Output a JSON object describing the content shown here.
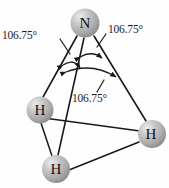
{
  "figure": {
    "background_color": "#fefefe",
    "width": 169,
    "height": 188
  },
  "atoms": [
    {
      "id": "n",
      "symbol": "N",
      "name": "nitrogen-atom",
      "cx": 85,
      "cy": 23,
      "r": 14.5,
      "color": "#a9a9a9"
    },
    {
      "id": "h1",
      "symbol": "H",
      "name": "hydrogen-atom-left",
      "cx": 40,
      "cy": 110,
      "r": 13.5,
      "color": "#a9a9a9"
    },
    {
      "id": "h2",
      "symbol": "H",
      "name": "hydrogen-atom-right",
      "cx": 152,
      "cy": 134,
      "r": 14.0,
      "color": "#a9a9a9"
    },
    {
      "id": "h3",
      "symbol": "H",
      "name": "hydrogen-atom-bottom",
      "cx": 56,
      "cy": 169,
      "r": 14.0,
      "color": "#a9a9a9"
    }
  ],
  "bonds": [
    {
      "name": "bond-n-h-left",
      "from": "n",
      "to": "h1"
    },
    {
      "name": "bond-n-h-right",
      "from": "n",
      "to": "h2"
    },
    {
      "name": "bond-n-h-bottom",
      "from": "n",
      "to": "h3"
    }
  ],
  "base_edges": [
    {
      "name": "base-edge-left-right",
      "from": "h1",
      "to": "h2"
    },
    {
      "name": "base-edge-left-bottom",
      "from": "h1",
      "to": "h3"
    },
    {
      "name": "base-edge-bottom-right",
      "from": "h3",
      "to": "h2"
    }
  ],
  "angles": {
    "left": {
      "value": "106.75",
      "unit": "°",
      "text": "106.75°"
    },
    "right": {
      "value": "106.75",
      "unit": "°",
      "text": "106.75°"
    },
    "middle": {
      "value": "106.75",
      "unit": "°",
      "text": "106.75°"
    }
  },
  "colors": {
    "line": "#1a1a1a",
    "text": "#1b1b1b",
    "sphere_light": "#e2e2e2",
    "sphere_mid": "#b4b4b4",
    "sphere_dark": "#8e8e8e"
  }
}
